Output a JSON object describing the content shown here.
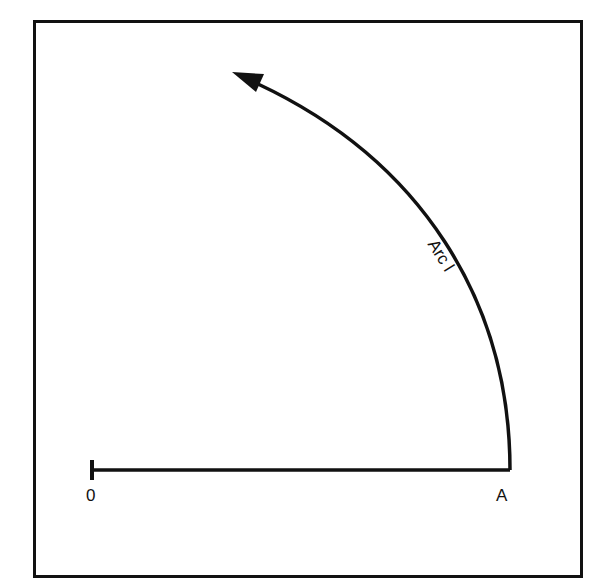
{
  "diagram": {
    "labels": {
      "origin": "0",
      "point_a": "A",
      "arc": "Arc l"
    },
    "colors": {
      "stroke": "#111111",
      "background": "#ffffff"
    }
  }
}
